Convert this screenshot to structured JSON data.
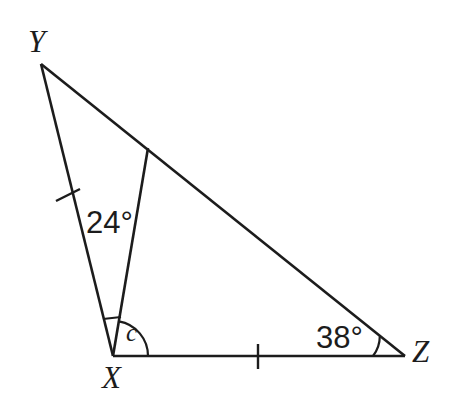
{
  "figure": {
    "kind": "geometry-diagram",
    "background_color": "#ffffff",
    "stroke_color": "#1c1c1c",
    "width": 450,
    "height": 416
  },
  "vertices": {
    "Y": {
      "label": "Y",
      "x": 41,
      "y": 64
    },
    "X": {
      "label": "X",
      "x": 113,
      "y": 356
    },
    "Z": {
      "label": "Z",
      "x": 405,
      "y": 356
    }
  },
  "points": {
    "cevian_end": {
      "label": "",
      "x": 148,
      "y": 148
    }
  },
  "segments": [
    {
      "name": "YX",
      "from": "Y",
      "to": "X",
      "tick_count": 1
    },
    {
      "name": "YZ",
      "from": "Y",
      "to": "Z",
      "tick_count": 0
    },
    {
      "name": "XZ",
      "from": "X",
      "to": "Z",
      "tick_count": 1
    },
    {
      "name": "X-to-cevian-end",
      "from": "X",
      "to": "cevian_end",
      "tick_count": 0
    }
  ],
  "angles": {
    "at_X_upper": {
      "label": "24°",
      "value": 24,
      "unit": "degrees",
      "marker": "straight-bar"
    },
    "at_X_lower": {
      "label": "c",
      "value": null,
      "unit": "unknown",
      "marker": "arc"
    },
    "at_Z": {
      "label": "38°",
      "value": 38,
      "unit": "degrees",
      "marker": "arc"
    }
  },
  "tick_marks": {
    "on_YX": {
      "x": 68,
      "y": 195
    },
    "on_XZ": {
      "x": 258,
      "y": 356
    }
  }
}
